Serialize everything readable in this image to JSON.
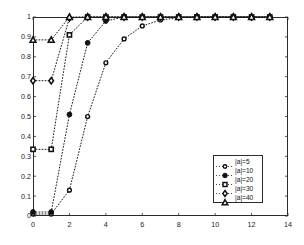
{
  "chart_data": {
    "type": "line",
    "title": "",
    "xlabel": "",
    "ylabel": "",
    "xlim": [
      0,
      14
    ],
    "ylim": [
      0,
      1
    ],
    "xticks": [
      0,
      2,
      4,
      6,
      8,
      10,
      12,
      14
    ],
    "xtick_labels": [
      "0",
      "2",
      "4",
      "6",
      "8",
      "10",
      "12",
      "14"
    ],
    "yticks": [
      0,
      0.1,
      0.2,
      0.3,
      0.4,
      0.5,
      0.6,
      0.7,
      0.8,
      0.9,
      1
    ],
    "ytick_labels": [
      "0",
      "0.1",
      "0.2",
      "0.3",
      "0.4",
      "0.5",
      "0.6",
      "0.7",
      "0.8",
      "0.9",
      "1"
    ],
    "grid": false,
    "line_style": "dotted",
    "line_color": "#1a1a1a",
    "legend_position": "lower right",
    "x": [
      0,
      1,
      2,
      3,
      4,
      5,
      6,
      7,
      8,
      9,
      10,
      11,
      12,
      13
    ],
    "series": [
      {
        "name": "|a|=5",
        "marker": "circle-open",
        "values": [
          0.01,
          0.01,
          0.13,
          0.5,
          0.77,
          0.89,
          0.955,
          0.985,
          0.997,
          1.0,
          1.0,
          1.0,
          1.0,
          1.0
        ]
      },
      {
        "name": "|a|=10",
        "marker": "circle-filled",
        "values": [
          0.02,
          0.02,
          0.51,
          0.87,
          0.98,
          1.0,
          1.0,
          1.0,
          1.0,
          1.0,
          1.0,
          1.0,
          1.0,
          1.0
        ]
      },
      {
        "name": "|a|=20",
        "marker": "square",
        "values": [
          0.335,
          0.335,
          0.91,
          1.0,
          1.0,
          1.0,
          1.0,
          1.0,
          1.0,
          1.0,
          1.0,
          1.0,
          1.0,
          1.0
        ]
      },
      {
        "name": "|a|=30",
        "marker": "diamond",
        "values": [
          0.68,
          0.68,
          0.995,
          1.0,
          1.0,
          1.0,
          1.0,
          1.0,
          1.0,
          1.0,
          1.0,
          1.0,
          1.0,
          1.0
        ]
      },
      {
        "name": "|a|=40",
        "marker": "triangle",
        "values": [
          0.885,
          0.885,
          1.0,
          1.0,
          1.0,
          1.0,
          1.0,
          1.0,
          1.0,
          1.0,
          1.0,
          1.0,
          1.0,
          1.0
        ]
      }
    ]
  },
  "legend": {
    "entries": [
      {
        "label": "|a|=5",
        "marker": "circle-open"
      },
      {
        "label": "|a|=10",
        "marker": "circle-filled"
      },
      {
        "label": "|a|=20",
        "marker": "square"
      },
      {
        "label": "|a|=30",
        "marker": "diamond"
      },
      {
        "label": "|a|=40",
        "marker": "triangle"
      }
    ]
  },
  "colors": {
    "axis": "#2b2b2b",
    "marker": "#111111",
    "line": "#1a1a1a",
    "background": "#ffffff"
  }
}
